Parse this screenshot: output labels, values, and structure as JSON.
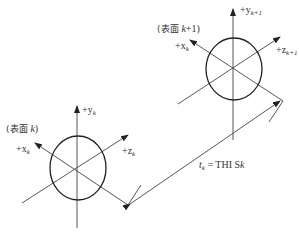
{
  "diagram": {
    "type": "coordinate-systems-thickness",
    "surface_k": {
      "label_prefix": "(表面 ",
      "label_var": "k",
      "label_suffix": ")",
      "axes": {
        "y": {
          "sign": "+y",
          "sub": "k"
        },
        "x": {
          "sign": "+x",
          "sub": "k"
        },
        "z": {
          "sign": "+z",
          "sub": "k"
        }
      }
    },
    "surface_k1": {
      "label_prefix": "(表面 ",
      "label_var": "k",
      "label_suffix": "+1)",
      "axes": {
        "y": {
          "sign": "+y",
          "sub": "k+1"
        },
        "x": {
          "sign": "+x",
          "sub": "k"
        },
        "z": {
          "sign": "+z",
          "sub": "k+1"
        }
      }
    },
    "dimension": {
      "var": "t",
      "sub": "k",
      "eq": " = THI S",
      "var2": "k"
    },
    "colors": {
      "line": "#444444",
      "background": "#ffffff"
    }
  }
}
